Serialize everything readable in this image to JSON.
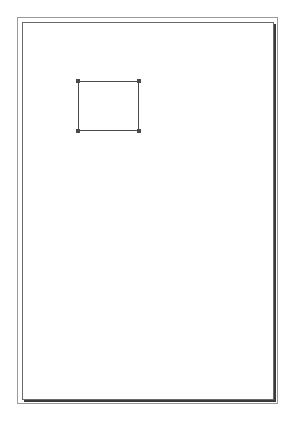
{
  "canvas": {
    "page": {
      "background": "#ffffff",
      "border_color": "#6a6a6a",
      "shadow_color": "#3a3a3a"
    },
    "frame": {
      "border_color": "#9a9a9a"
    },
    "shapes": [
      {
        "type": "rectangle",
        "selected": true,
        "stroke_color": "#4a4a4a",
        "handles": [
          "top-left",
          "top-right",
          "bottom-left",
          "bottom-right"
        ]
      }
    ]
  }
}
